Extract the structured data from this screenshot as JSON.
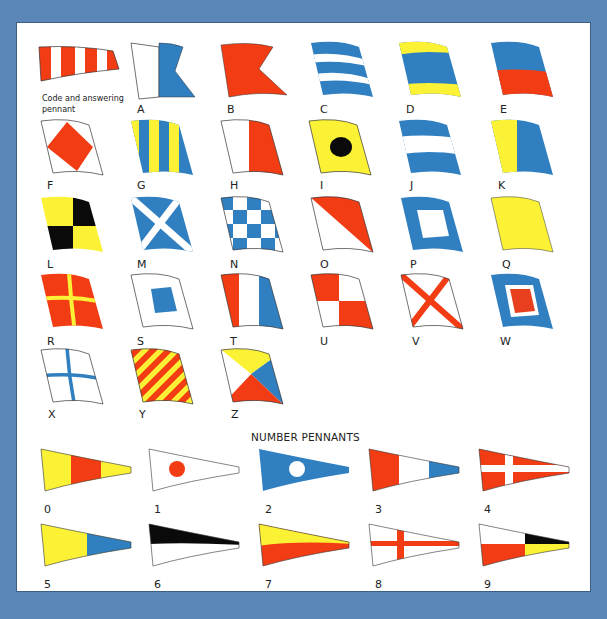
{
  "colors": {
    "background": "#5b86b8",
    "panel": "#ffffff",
    "red": "#f23c14",
    "blue": "#2f7fc1",
    "yellow": "#fbf236",
    "black": "#0a0a0a",
    "white": "#ffffff"
  },
  "code_pennant": {
    "caption": "Code and answering pennant",
    "design": "red-white vertical stripes, tapered"
  },
  "letter_flags": [
    {
      "label": "A",
      "design": "white hoist, blue swallowtail fly"
    },
    {
      "label": "B",
      "design": "red swallowtail"
    },
    {
      "label": "C",
      "design": "blue-white-red-white-blue horizontal stripes (shown blue/white)"
    },
    {
      "label": "D",
      "design": "yellow-blue-yellow horizontal bands"
    },
    {
      "label": "E",
      "design": "blue over red"
    },
    {
      "label": "F",
      "design": "white with red diamond"
    },
    {
      "label": "G",
      "design": "yellow/blue vertical stripes"
    },
    {
      "label": "H",
      "design": "white hoist, red fly"
    },
    {
      "label": "I",
      "design": "yellow with black circle"
    },
    {
      "label": "J",
      "design": "blue-white-blue horizontal"
    },
    {
      "label": "K",
      "design": "yellow hoist, blue fly"
    },
    {
      "label": "L",
      "design": "yellow/black quarters"
    },
    {
      "label": "M",
      "design": "blue with white saltire"
    },
    {
      "label": "N",
      "design": "blue/white checkers"
    },
    {
      "label": "O",
      "design": "red/white diagonal"
    },
    {
      "label": "P",
      "design": "blue with white square"
    },
    {
      "label": "Q",
      "design": "yellow"
    },
    {
      "label": "R",
      "design": "red with yellow cross"
    },
    {
      "label": "S",
      "design": "white with blue square"
    },
    {
      "label": "T",
      "design": "red-white-blue vertical"
    },
    {
      "label": "U",
      "design": "red/white quarters"
    },
    {
      "label": "V",
      "design": "white with red saltire"
    },
    {
      "label": "W",
      "design": "blue, white, red centre"
    },
    {
      "label": "X",
      "design": "white with blue cross"
    },
    {
      "label": "Y",
      "design": "yellow/red diagonal stripes"
    },
    {
      "label": "Z",
      "design": "yellow/blue/red/black triangles"
    }
  ],
  "number_pennants": {
    "title": "NUMBER PENNANTS",
    "items": [
      {
        "label": "0",
        "design": "yellow-red-yellow"
      },
      {
        "label": "1",
        "design": "white with red dot"
      },
      {
        "label": "2",
        "design": "blue with white dot"
      },
      {
        "label": "3",
        "design": "red-white-blue"
      },
      {
        "label": "4",
        "design": "red with white cross"
      },
      {
        "label": "5",
        "design": "yellow-blue"
      },
      {
        "label": "6",
        "design": "black over white"
      },
      {
        "label": "7",
        "design": "yellow over red"
      },
      {
        "label": "8",
        "design": "white with red cross"
      },
      {
        "label": "9",
        "design": "white/red hoist, black/yellow fly"
      }
    ]
  }
}
